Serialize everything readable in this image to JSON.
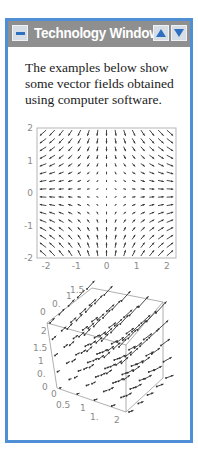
{
  "window": {
    "title": "Technology Window",
    "border_color": "#4f8fd6",
    "titlebar_color": "#8f8f8f",
    "buttons": {
      "minimize": "minimize-icon",
      "scroll_up": "up-arrow-icon",
      "scroll_down": "down-arrow-icon"
    }
  },
  "intro_text": "The examples below show some vector fields obtained using computer software.",
  "chart_data": [
    {
      "type": "vector_field_2d",
      "field": "F(x,y) = (x, -y)",
      "xlim": [
        -2.3,
        2.3
      ],
      "ylim": [
        -2,
        2
      ],
      "x_ticks": [
        "-2",
        "-1",
        "0",
        "1",
        "2"
      ],
      "y_ticks": [
        "2",
        "1",
        "0",
        "-1",
        "-2"
      ],
      "grid": false,
      "title": "",
      "xlabel": "",
      "ylabel": ""
    },
    {
      "type": "vector_field_3d",
      "field": "arrows pointing outward/upward-right, growing with distance from origin",
      "x_ticks": [
        "0",
        "0.5",
        "1",
        "1.",
        "2"
      ],
      "y_ticks": [
        "0",
        "0.",
        "1",
        "1.5"
      ],
      "z_ticks": [
        "0",
        "0.",
        "1",
        "1.5",
        "2"
      ],
      "box": true
    }
  ],
  "plot2d": {
    "x_tick_labels": [
      "-2",
      "-1",
      "0",
      "1",
      "2"
    ],
    "y_tick_labels": [
      "2",
      "1",
      "0",
      "-1",
      "-2"
    ]
  },
  "plot3d": {
    "top_labels": [
      "0",
      "0.",
      "1",
      "1.5"
    ],
    "left_labels": [
      "2",
      "1.5",
      "1",
      "0.",
      "0"
    ],
    "bottom_labels": [
      "0",
      "0.5",
      "1",
      "1.",
      "2"
    ]
  }
}
